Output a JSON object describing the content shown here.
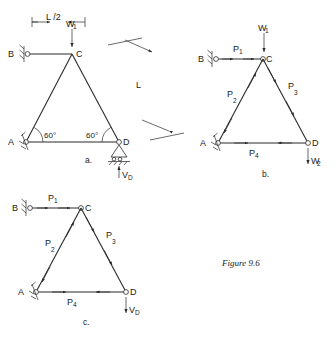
{
  "figure": {
    "caption": "Figure 9.6",
    "sub_captions": {
      "a": "a.",
      "b": "b.",
      "c": "c."
    }
  },
  "diagram_a": {
    "name": "truss-loaded-geometry",
    "joints": {
      "A": "A",
      "B": "B",
      "C": "C",
      "D": "D"
    },
    "angles": {
      "left": "60°",
      "right": "60°"
    },
    "dimensions": {
      "half_span": "L /2",
      "member_length": "L"
    },
    "loads": {
      "vertical_at_c": {
        "label": "W",
        "sub": "1",
        "direction": "down"
      },
      "reaction_at_d": {
        "label": "V",
        "sub": "D",
        "direction": "up"
      }
    },
    "supports": {
      "B": "pin-support-hatched",
      "A": "pin-support-hatched",
      "D": "roller-support"
    }
  },
  "diagram_b": {
    "name": "free-body-member-forces-b",
    "joints": {
      "A": "A",
      "B": "B",
      "C": "C",
      "D": "D"
    },
    "member_forces": [
      {
        "label": "P",
        "sub": "1",
        "member": "B-C",
        "sense": "outward"
      },
      {
        "label": "P",
        "sub": "2",
        "member": "A-C",
        "sense": "outward"
      },
      {
        "label": "P",
        "sub": "3",
        "member": "C-D",
        "sense": "inward"
      },
      {
        "label": "P",
        "sub": "4",
        "member": "A-D",
        "sense": "inward"
      }
    ],
    "loads": {
      "vertical_at_c": {
        "label": "W",
        "sub": "1",
        "direction": "down"
      },
      "vertical_at_d": {
        "label": "W",
        "sub": "2",
        "direction": "down"
      }
    },
    "supports": {
      "B": "pin-support-hatched",
      "A": "pin-support-hatched"
    }
  },
  "diagram_c": {
    "name": "free-body-member-forces-c",
    "joints": {
      "A": "A",
      "B": "B",
      "C": "C",
      "D": "D"
    },
    "member_forces": [
      {
        "label": "P",
        "sub": "1",
        "member": "B-C",
        "sense": "outward"
      },
      {
        "label": "P",
        "sub": "2",
        "member": "A-C",
        "sense": "outward"
      },
      {
        "label": "P",
        "sub": "3",
        "member": "C-D",
        "sense": "inward"
      },
      {
        "label": "P",
        "sub": "4",
        "member": "A-D",
        "sense": "inward"
      }
    ],
    "loads": {
      "reaction_at_d": {
        "label": "V",
        "sub": "D",
        "direction": "down"
      }
    },
    "supports": {
      "B": "pin-support-hatched",
      "A": "pin-support-hatched"
    }
  },
  "colors": {
    "ink": "#1a1a1a",
    "line": "#2a2a2a",
    "paper": "#ffffff"
  }
}
